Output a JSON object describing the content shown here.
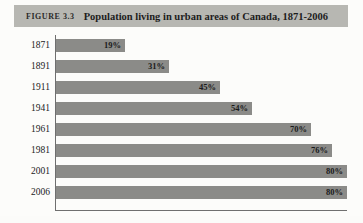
{
  "caption": {
    "figure_number": "FIGURE 3.3",
    "title": "Population living in urban areas of Canada, 1871-2006"
  },
  "chart_data": {
    "type": "bar",
    "orientation": "horizontal",
    "title": "Population living in urban areas of Canada, 1871-2006",
    "xlabel": "",
    "ylabel": "",
    "xlim": [
      0,
      80
    ],
    "grid": false,
    "legend": "none",
    "value_suffix": "%",
    "bar_color": "#8b8b88",
    "categories": [
      "1871",
      "1891",
      "1911",
      "1941",
      "1961",
      "1981",
      "2001",
      "2006"
    ],
    "values": [
      19,
      31,
      45,
      54,
      70,
      76,
      80,
      80
    ],
    "value_labels": [
      "19%",
      "31%",
      "45%",
      "54%",
      "70%",
      "76%",
      "80%",
      "80%"
    ],
    "rows": [
      {
        "category": "1871",
        "value": 19,
        "label": "19%"
      },
      {
        "category": "1891",
        "value": 31,
        "label": "31%"
      },
      {
        "category": "1911",
        "value": 45,
        "label": "45%"
      },
      {
        "category": "1941",
        "value": 54,
        "label": "54%"
      },
      {
        "category": "1961",
        "value": 70,
        "label": "70%"
      },
      {
        "category": "1981",
        "value": 76,
        "label": "76%"
      },
      {
        "category": "2001",
        "value": 80,
        "label": "80%"
      },
      {
        "category": "2006",
        "value": 80,
        "label": "80%"
      }
    ]
  },
  "colors": {
    "caption_band": "#b7b7b2",
    "bar": "#8b8b88",
    "axis": "#6f6f6f",
    "background": "#fcfcfa"
  }
}
